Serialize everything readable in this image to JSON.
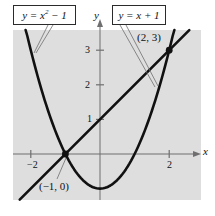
{
  "figure": {
    "type": "graph",
    "background_color": "#ffffff",
    "plot_background_color": "#dedede",
    "curve_color": "#111111",
    "axis_color": "#6f6f6f"
  },
  "labels": {
    "parabola_box": "y = x² − 1",
    "parabola_box_parts": {
      "lhs": "y = x",
      "exponent": "2",
      "rhs": " − 1"
    },
    "line_box": "y = x + 1",
    "point_upper": "(2, 3)",
    "point_lower": "(−1, 0)"
  },
  "axes": {
    "x_name": "x",
    "y_name": "y",
    "x_ticks": [
      "−2",
      "2"
    ],
    "y_ticks": [
      "3",
      "2",
      "1"
    ],
    "x_range": [
      -2.5,
      2.6
    ],
    "y_range": [
      -1.3,
      3.6
    ],
    "origin_px": [
      100,
      154
    ],
    "unit_px": 34.6
  },
  "chart_data": {
    "type": "line",
    "title": "",
    "xlabel": "x",
    "ylabel": "y",
    "xlim": [
      -2.5,
      2.6
    ],
    "ylim": [
      -1.3,
      3.6
    ],
    "grid": false,
    "legend": "inline-boxed-labels",
    "series": [
      {
        "name": "y = x² − 1",
        "equation": "y = x^2 - 1",
        "kind": "parabola",
        "vertex": [
          0,
          -1
        ],
        "roots": [
          -1,
          1
        ]
      },
      {
        "name": "y = x + 1",
        "equation": "y = x + 1",
        "kind": "line",
        "slope": 1,
        "intercept": 1
      }
    ],
    "annotations": [
      {
        "label": "(2, 3)",
        "x": 2,
        "y": 3,
        "marker": "filled-dot"
      },
      {
        "label": "(−1, 0)",
        "x": -1,
        "y": 0,
        "marker": "filled-dot"
      }
    ],
    "xticks": [
      -2,
      2
    ],
    "yticks": [
      1,
      2,
      3
    ]
  }
}
